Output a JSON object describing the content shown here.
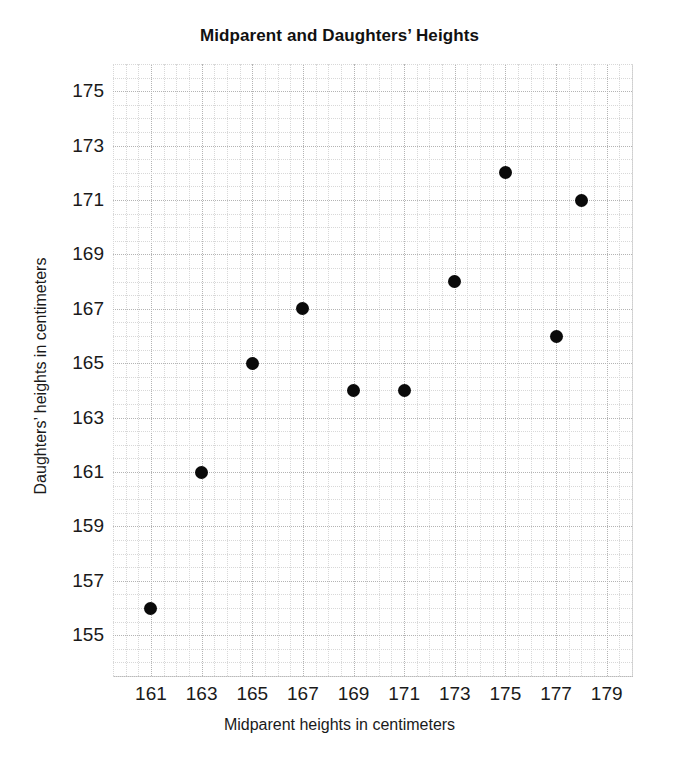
{
  "chart_data": {
    "type": "scatter",
    "title": "Midparent and Daughters’ Heights",
    "xlabel": "Midparent heights in centimeters",
    "ylabel": "Daughters’ heights in centimeters",
    "xlim": [
      159.5,
      180.0
    ],
    "ylim": [
      153.5,
      176.0
    ],
    "xticks": [
      161,
      163,
      165,
      167,
      169,
      171,
      173,
      175,
      177,
      179
    ],
    "yticks": [
      155,
      157,
      159,
      161,
      163,
      165,
      167,
      169,
      171,
      173,
      175
    ],
    "xtick_labels": [
      "161",
      "163",
      "165",
      "167",
      "169",
      "171",
      "173",
      "175",
      "177",
      "179"
    ],
    "ytick_labels": [
      "155",
      "157",
      "159",
      "161",
      "163",
      "165",
      "167",
      "169",
      "171",
      "173",
      "175"
    ],
    "grid": true,
    "grid_style": "dotted",
    "minor_grid": true,
    "legend": null,
    "marker": "filled-circle",
    "marker_color": "#0a0a0a",
    "marker_size": 13,
    "x": [
      161,
      163,
      165,
      167,
      169,
      171,
      173,
      175,
      177,
      178
    ],
    "y": [
      156,
      161,
      165,
      167,
      164,
      164,
      168,
      172,
      166,
      171
    ],
    "points": [
      {
        "x": 161,
        "y": 156
      },
      {
        "x": 163,
        "y": 161
      },
      {
        "x": 165,
        "y": 165
      },
      {
        "x": 167,
        "y": 167
      },
      {
        "x": 169,
        "y": 164
      },
      {
        "x": 171,
        "y": 164
      },
      {
        "x": 173,
        "y": 168
      },
      {
        "x": 175,
        "y": 172
      },
      {
        "x": 177,
        "y": 166
      },
      {
        "x": 178,
        "y": 171
      }
    ]
  },
  "axis_colors": {
    "grid_major": "#b4b4b4",
    "grid_minor": "#d8d8d8",
    "frame": "#b8b8b8",
    "text": "#1a1a1a",
    "background": "#ffffff"
  }
}
